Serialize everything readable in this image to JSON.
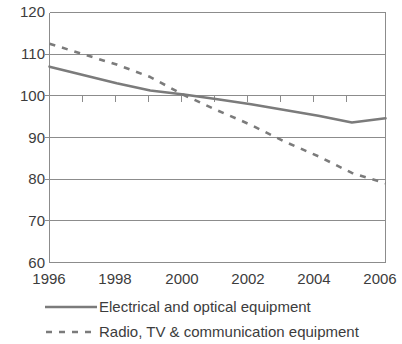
{
  "chart_data": {
    "type": "line",
    "title": "",
    "xlabel": "",
    "ylabel": "",
    "xlim": [
      1996,
      2006
    ],
    "ylim": [
      60,
      120
    ],
    "yticks": [
      120,
      110,
      100,
      90,
      80,
      70,
      60
    ],
    "xticks": [
      1996,
      1998,
      2000,
      2002,
      2004,
      2006
    ],
    "xtick_labels": [
      "1996",
      "1998",
      "2000",
      "2002",
      "2004",
      "2006"
    ],
    "ytick_labels": [
      "120",
      "110",
      "100",
      "90",
      "80",
      "70",
      "60"
    ],
    "grid": true,
    "grid_axis": "y",
    "legend_position": "bottom",
    "x": [
      1996,
      1997,
      1998,
      1999,
      2000,
      2001,
      2002,
      2003,
      2004,
      2005,
      2006
    ],
    "series": [
      {
        "name": "Electrical and optical equipment",
        "style": "solid",
        "color": "#7b7b7b",
        "values": [
          107.0,
          105.0,
          103.0,
          101.3,
          100.3,
          99.2,
          98.0,
          96.6,
          95.2,
          93.6,
          94.6
        ]
      },
      {
        "name": "Radio, TV & communication equipment",
        "style": "dashed",
        "color": "#7b7b7b",
        "values": [
          112.5,
          110.0,
          107.5,
          104.5,
          100.2,
          96.5,
          93.0,
          89.0,
          85.5,
          81.5,
          79.0
        ]
      }
    ]
  },
  "axis": {
    "y_labels": [
      "120",
      "110",
      "100",
      "90",
      "80",
      "70",
      "60"
    ],
    "x_labels": [
      "1996",
      "1998",
      "2000",
      "2002",
      "2004",
      "2006"
    ]
  },
  "legend": {
    "entries": [
      {
        "label": "Electrical and optical equipment",
        "style": "solid"
      },
      {
        "label": "Radio, TV & communication equipment",
        "style": "dashed"
      }
    ]
  },
  "colors": {
    "line": "#7b7b7b",
    "grid": "#8c8c8c",
    "text": "#3c3c3c",
    "background": "#ffffff"
  }
}
